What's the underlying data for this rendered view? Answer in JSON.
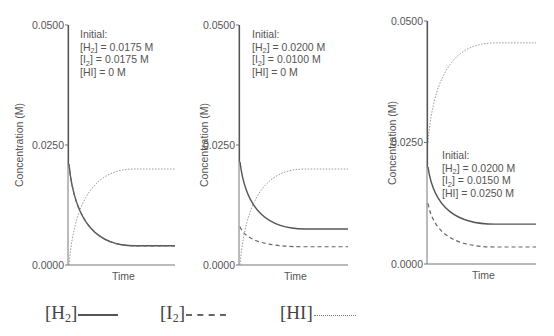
{
  "chart_data": [
    {
      "type": "line",
      "title": "",
      "xlabel": "Time",
      "ylabel": "Concentration (M)",
      "ylim": [
        0,
        0.05
      ],
      "yticks": [
        "0.0000",
        "0.0250",
        "0.0500"
      ],
      "annotation": [
        "Initial:",
        "[H2] = 0.0175 M",
        "[I2] = 0.0175 M",
        "[HI] = 0 M"
      ],
      "series": [
        {
          "name": "[H2]",
          "style": "solid",
          "start": 0.021,
          "end": 0.004
        },
        {
          "name": "[I2]",
          "style": "dashed",
          "start": 0.021,
          "end": 0.004
        },
        {
          "name": "[HI]",
          "style": "dotted",
          "start": 0.0,
          "end": 0.02
        }
      ]
    },
    {
      "type": "line",
      "title": "",
      "xlabel": "Time",
      "ylabel": "Concentration (M)",
      "ylim": [
        0,
        0.05
      ],
      "yticks": [
        "0.0000",
        "0.0250",
        "0.0500"
      ],
      "annotation": [
        "Initial:",
        "[H2] = 0.0200 M",
        "[I2] = 0.0100 M",
        "[HI] = 0 M"
      ],
      "series": [
        {
          "name": "[H2]",
          "style": "solid",
          "start": 0.0215,
          "end": 0.0075
        },
        {
          "name": "[I2]",
          "style": "dashed",
          "start": 0.008,
          "end": 0.0038
        },
        {
          "name": "[HI]",
          "style": "dotted",
          "start": 0.0,
          "end": 0.02
        }
      ]
    },
    {
      "type": "line",
      "title": "",
      "xlabel": "Time",
      "ylabel": "Concentration (M)",
      "ylim": [
        0,
        0.05
      ],
      "yticks": [
        "0.0000",
        "0.0250",
        "0.0500"
      ],
      "annotation": [
        "Initial:",
        "[H2] = 0.0200 M",
        "[I2] = 0.0150 M",
        "[HI] = 0.0250 M"
      ],
      "series": [
        {
          "name": "[H2]",
          "style": "solid",
          "start": 0.02,
          "end": 0.0082
        },
        {
          "name": "[I2]",
          "style": "dashed",
          "start": 0.0125,
          "end": 0.0035
        },
        {
          "name": "[HI]",
          "style": "dotted",
          "start": 0.025,
          "end": 0.0455
        }
      ]
    }
  ],
  "legend": [
    {
      "base": "[H",
      "sub": "2",
      "close": "]",
      "style": "solid"
    },
    {
      "base": "[I",
      "sub": "2",
      "close": "]",
      "style": "dashed"
    },
    {
      "base": "[HI]",
      "sub": "",
      "close": "",
      "style": "dotted"
    }
  ],
  "colors": {
    "h2": "#555555",
    "i2": "#666666",
    "hi": "#9a9a9a",
    "axis": "#777777",
    "text": "#555555"
  }
}
